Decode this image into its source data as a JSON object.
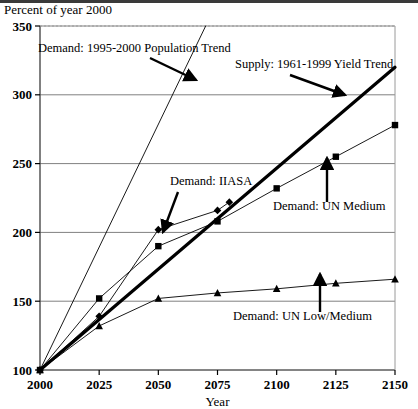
{
  "page": {
    "title": "Percent of year 2000"
  },
  "chart_data": {
    "type": "line",
    "title": "Percent of year 2000",
    "xlabel": "Year",
    "ylabel": "Percent of year 2000",
    "xlim": [
      2000,
      2150
    ],
    "ylim": [
      100,
      350
    ],
    "grid": true,
    "legend_position": "inline-annotations",
    "x_ticks": [
      "2000",
      "2025",
      "2050",
      "2075",
      "2100",
      "2125",
      "2150"
    ],
    "y_ticks": [
      "100",
      "150",
      "200",
      "250",
      "300",
      "350"
    ],
    "x": [
      2000,
      2025,
      2050,
      2075,
      2100,
      2125,
      2150
    ],
    "series": [
      {
        "name": "Demand: 1995-2000 Population Trend",
        "marker": "none",
        "style": "thin",
        "x": [
          2000,
          2070
        ],
        "values": [
          100,
          350
        ]
      },
      {
        "name": "Supply: 1961-1999 Yield Trend",
        "marker": "none",
        "style": "thick",
        "x": [
          2000,
          2150
        ],
        "values": [
          100,
          320
        ]
      },
      {
        "name": "Demand: IIASA",
        "marker": "diamond",
        "style": "thin",
        "x": [
          2000,
          2025,
          2050,
          2075,
          2080
        ],
        "values": [
          100,
          139,
          202,
          216,
          222
        ]
      },
      {
        "name": "Demand: UN Medium",
        "marker": "square",
        "style": "thin",
        "x": [
          2000,
          2025,
          2050,
          2075,
          2100,
          2125,
          2150
        ],
        "values": [
          100,
          152,
          190,
          208,
          232,
          255,
          278
        ]
      },
      {
        "name": "Demand: UN Low/Medium",
        "marker": "triangle",
        "style": "thin",
        "x": [
          2000,
          2025,
          2050,
          2075,
          2100,
          2125,
          2150
        ],
        "values": [
          100,
          132,
          152,
          156,
          159,
          163,
          166
        ]
      }
    ],
    "annotations": [
      {
        "label": "Demand: 1995-2000 Population Trend",
        "text_x": 38,
        "text_y": 52,
        "arrow": {
          "x1": 150,
          "y1": 58,
          "x2": 196,
          "y2": 80
        }
      },
      {
        "label": "Supply: 1961-1999 Yield Trend",
        "text_x": 235,
        "text_y": 68,
        "arrow": {
          "x1": 290,
          "y1": 75,
          "x2": 345,
          "y2": 95
        }
      },
      {
        "label": "Demand: IIASA",
        "text_x": 170,
        "text_y": 185,
        "arrow": {
          "x1": 178,
          "y1": 192,
          "x2": 163,
          "y2": 232
        }
      },
      {
        "label": "Demand: UN Medium",
        "text_x": 273,
        "text_y": 210,
        "arrow": {
          "x1": 327,
          "y1": 202,
          "x2": 327,
          "y2": 158
        }
      },
      {
        "label": "Demand: UN Low/Medium",
        "text_x": 233,
        "text_y": 320,
        "arrow": {
          "x1": 320,
          "y1": 312,
          "x2": 320,
          "y2": 274
        }
      }
    ]
  }
}
